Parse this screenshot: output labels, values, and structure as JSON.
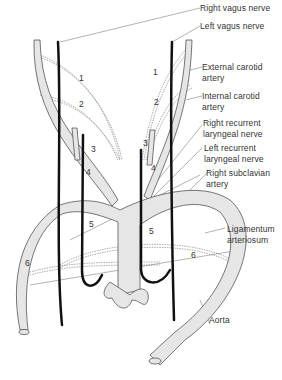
{
  "labels": {
    "right_vagus": "Right vagus nerve",
    "left_vagus": "Left vagus nerve",
    "external_carotid_1": "External carotid",
    "external_carotid_2": "artery",
    "internal_carotid_1": "Internal carotid",
    "internal_carotid_2": "artery",
    "right_recurrent_1": "Right recurrent",
    "right_recurrent_2": "laryngeal nerve",
    "left_recurrent_1": "Left recurrent",
    "left_recurrent_2": "laryngeal nerve",
    "right_subclavian_1": "Right subclavian",
    "right_subclavian_2": "artery",
    "ligamentum_1": "Ligamentum",
    "ligamentum_2": "arteriosum",
    "aorta": "Aorta"
  },
  "arch_numbers": {
    "l1": "1",
    "r1": "1",
    "l2": "2",
    "r2": "2",
    "l3": "3",
    "r3": "3",
    "l4": "4",
    "r4": "4",
    "l5": "5",
    "r5": "5",
    "l6": "6",
    "r6": "6"
  },
  "colors": {
    "vessel_fill": "#e6e6e6",
    "vessel_stroke": "#555555",
    "nerve": "#111111",
    "dashed": "#888888"
  }
}
